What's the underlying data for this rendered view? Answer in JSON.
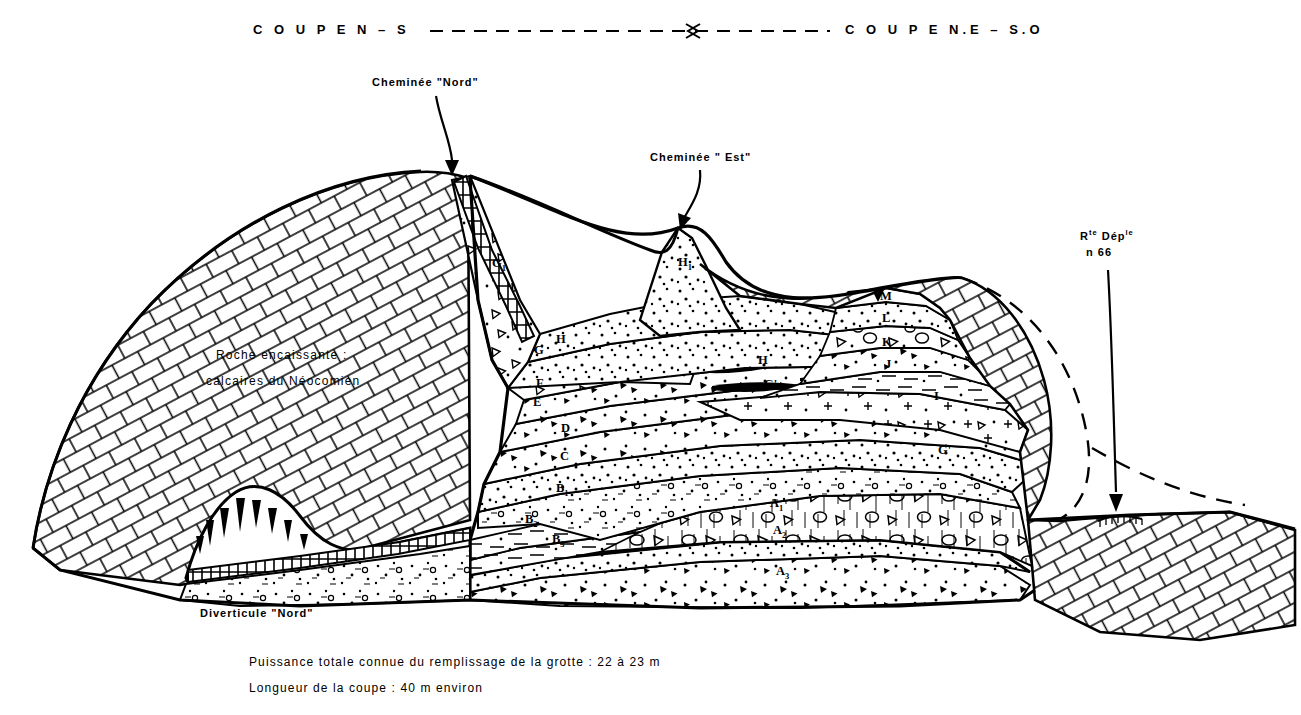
{
  "figure": {
    "kind": "geological-cross-section",
    "headers": {
      "left_section": "C O U P E    N – S",
      "right_section": "C O U P E    N.E – S.O",
      "arrow_symbol": "double-headed-dashed-arrow"
    },
    "annotations": [
      {
        "id": "cheminee-nord",
        "label": "Cheminée \"Nord\"",
        "x": 372,
        "y": 84
      },
      {
        "id": "cheminee-est",
        "label": "Cheminée \" Est\"",
        "x": 650,
        "y": 159
      },
      {
        "id": "route",
        "label_line1": "R",
        "label_sup1": "te",
        "label_line1b": " Dép",
        "label_sup2": "le",
        "label_line2": "n 66",
        "x": 1078,
        "y": 242
      },
      {
        "id": "diverticule-nord",
        "label": "Diverticule \"Nord\"",
        "x": 200,
        "y": 615
      }
    ],
    "bedrock": {
      "label_line1": "Roche  encaissante :",
      "label_line2": "calcaires  du  Néocomien",
      "pattern": "brick-masonry-hatching"
    },
    "captions": [
      "Puissance totale connue du remplissage de la grotte : 22  à  23 m",
      "Longueur de la coupe : 40 m  environ"
    ],
    "units": [
      {
        "label": "G",
        "sub": "1",
        "x": 497,
        "y": 265
      },
      {
        "label": "G",
        "sub": "",
        "x": 537,
        "y": 350
      },
      {
        "label": "G'",
        "sub": "",
        "x": 533,
        "y": 352
      },
      {
        "label": "H",
        "sub": "1",
        "x": 686,
        "y": 265
      },
      {
        "label": "H",
        "sub": "",
        "x": 762,
        "y": 362
      },
      {
        "label": "H",
        "sub": "",
        "x": 561,
        "y": 341
      },
      {
        "label": "F",
        "sub": "",
        "x": 540,
        "y": 385
      },
      {
        "label": "E",
        "sub": "",
        "x": 537,
        "y": 404
      },
      {
        "label": "D",
        "sub": "",
        "x": 565,
        "y": 430
      },
      {
        "label": "C",
        "sub": "",
        "x": 564,
        "y": 458
      },
      {
        "label": "B",
        "sub": "1",
        "x": 562,
        "y": 490
      },
      {
        "label": "B",
        "sub": "2",
        "x": 531,
        "y": 521
      },
      {
        "label": "B",
        "sub": "3",
        "x": 558,
        "y": 541
      },
      {
        "label": "A",
        "sub": "1",
        "x": 776,
        "y": 505
      },
      {
        "label": "A",
        "sub": "2",
        "x": 779,
        "y": 532
      },
      {
        "label": "A",
        "sub": "3",
        "x": 782,
        "y": 573
      },
      {
        "label": "I",
        "sub": "",
        "x": 936,
        "y": 398
      },
      {
        "label": "J",
        "sub": "",
        "x": 888,
        "y": 366
      },
      {
        "label": "K",
        "sub": "",
        "x": 886,
        "y": 344
      },
      {
        "label": "L",
        "sub": "",
        "x": 885,
        "y": 320
      },
      {
        "label": "M",
        "sub": "",
        "x": 884,
        "y": 298
      },
      {
        "label": "G'",
        "sub": "",
        "x": 944,
        "y": 452
      },
      {
        "label": "G'",
        "sub": "",
        "x": 768,
        "y": 386
      }
    ],
    "colors": {
      "ink": "#000000",
      "paper": "#ffffff"
    }
  }
}
